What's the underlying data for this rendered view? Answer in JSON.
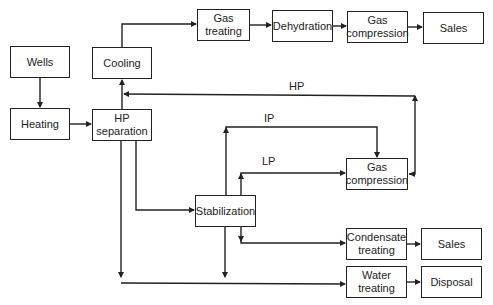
{
  "diagram": {
    "type": "process-flow",
    "nodes": [
      {
        "id": "wells",
        "label": "Wells"
      },
      {
        "id": "heating",
        "label": "Heating"
      },
      {
        "id": "cooling",
        "label": "Cooling"
      },
      {
        "id": "hp_separation",
        "label": "HP separation"
      },
      {
        "id": "gas_treating",
        "label": "Gas treating"
      },
      {
        "id": "dehydration",
        "label": "Dehydration"
      },
      {
        "id": "gas_compression_top",
        "label": "Gas compression"
      },
      {
        "id": "sales_gas",
        "label": "Sales"
      },
      {
        "id": "stabilization",
        "label": "Stabilization"
      },
      {
        "id": "gas_compression_mid",
        "label": "Gas compression"
      },
      {
        "id": "condensate_treating",
        "label": "Condensate treating"
      },
      {
        "id": "sales_condensate",
        "label": "Sales"
      },
      {
        "id": "water_treating",
        "label": "Water treating"
      },
      {
        "id": "disposal",
        "label": "Disposal"
      }
    ],
    "edges": [
      {
        "from": "wells",
        "to": "heating"
      },
      {
        "from": "heating",
        "to": "hp_separation"
      },
      {
        "from": "hp_separation",
        "to": "cooling"
      },
      {
        "from": "cooling",
        "to": "gas_treating"
      },
      {
        "from": "gas_treating",
        "to": "dehydration"
      },
      {
        "from": "dehydration",
        "to": "gas_compression_top"
      },
      {
        "from": "gas_compression_top",
        "to": "sales_gas"
      },
      {
        "from": "hp_separation",
        "to": "stabilization"
      },
      {
        "from": "hp_separation",
        "to": "water_treating"
      },
      {
        "from": "stabilization",
        "to": "gas_compression_mid",
        "label": "IP"
      },
      {
        "from": "stabilization",
        "to": "gas_compression_mid",
        "label": "LP"
      },
      {
        "from": "stabilization",
        "to": "condensate_treating"
      },
      {
        "from": "stabilization",
        "to": "water_treating"
      },
      {
        "from": "gas_compression_mid",
        "to": "hp_separation",
        "label": "HP"
      },
      {
        "from": "condensate_treating",
        "to": "sales_condensate"
      },
      {
        "from": "water_treating",
        "to": "disposal"
      }
    ],
    "line_labels": {
      "hp": "HP",
      "ip": "IP",
      "lp": "LP"
    }
  },
  "boxes": {
    "wells": {
      "l1": "Wells"
    },
    "heating": {
      "l1": "Heating"
    },
    "cooling": {
      "l1": "Cooling"
    },
    "hp_separation": {
      "l1": "HP",
      "l2": "separation"
    },
    "gas_treating": {
      "l1": "Gas",
      "l2": "treating"
    },
    "dehydration": {
      "l1": "Dehydration"
    },
    "gas_compression_top": {
      "l1": "Gas",
      "l2": "compression"
    },
    "sales_gas": {
      "l1": "Sales"
    },
    "stabilization": {
      "l1": "Stabilization"
    },
    "gas_compression_mid": {
      "l1": "Gas",
      "l2": "compression"
    },
    "condensate_treating": {
      "l1": "Condensate",
      "l2": "treating"
    },
    "sales_condensate": {
      "l1": "Sales"
    },
    "water_treating": {
      "l1": "Water",
      "l2": "treating"
    },
    "disposal": {
      "l1": "Disposal"
    }
  }
}
